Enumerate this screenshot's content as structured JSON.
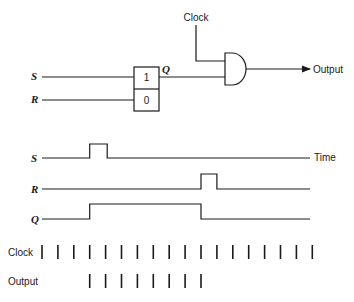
{
  "circuit": {
    "inputs": {
      "s_label": "S",
      "r_label": "R"
    },
    "flipflop": {
      "set_cell": "1",
      "reset_cell": "0",
      "output_label": "Q"
    },
    "gate": {
      "type": "AND",
      "clock_label": "Clock",
      "output_label": "Output"
    }
  },
  "timing": {
    "time_label": "Time",
    "signals": [
      {
        "name": "S",
        "high_intervals": [
          [
            3,
            4.1
          ]
        ]
      },
      {
        "name": "R",
        "high_intervals": [
          [
            10,
            11
          ]
        ]
      },
      {
        "name": "Q",
        "high_intervals": [
          [
            3,
            10
          ]
        ]
      }
    ],
    "clock": {
      "label": "Clock",
      "pulse_count": 18
    },
    "output": {
      "label": "Output",
      "pulse_indices": [
        3,
        4,
        5,
        6,
        7,
        8,
        9,
        10
      ]
    }
  }
}
